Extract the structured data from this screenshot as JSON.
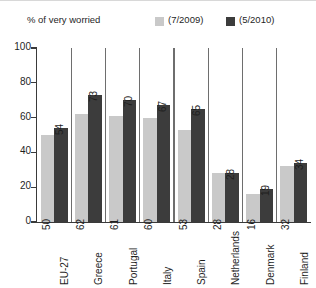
{
  "legend": {
    "title": "% of very worried",
    "entries": [
      {
        "label": "(7/2009)",
        "color": "#c9c9c9",
        "swatch": "legend-swatch-light"
      },
      {
        "label": "(5/2010)",
        "color": "#3c3c3c",
        "swatch": "legend-swatch-dark"
      }
    ]
  },
  "axis": {
    "y_ticks": [
      "100",
      "80",
      "60",
      "40",
      "20",
      "0"
    ]
  },
  "chart_data": {
    "type": "bar",
    "title": "% of very worried",
    "xlabel": "",
    "ylabel": "",
    "ylim": [
      0,
      100
    ],
    "yticks": [
      0,
      20,
      40,
      60,
      80,
      100
    ],
    "grid": false,
    "legend_position": "top",
    "categories": [
      "EU-27",
      "Greece",
      "Portugal",
      "Italy",
      "Spain",
      "Netherlands",
      "Denmark",
      "Finland"
    ],
    "series": [
      {
        "name": "(7/2009)",
        "color": "#c9c9c9",
        "values": [
          50,
          62,
          61,
          60,
          53,
          28,
          16,
          32
        ]
      },
      {
        "name": "(5/2010)",
        "color": "#3c3c3c",
        "values": [
          54,
          73,
          70,
          67,
          65,
          28,
          19,
          34
        ]
      }
    ]
  }
}
